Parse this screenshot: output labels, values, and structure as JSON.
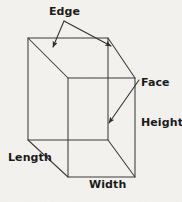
{
  "figure": {
    "background_color": "#f7f6f4",
    "line_color": "#3b3b3b",
    "text_color": "#1b1b1b",
    "labels": {
      "edge": "Edge",
      "face": "Face",
      "height": "Height",
      "length": "Length",
      "width": "Width"
    },
    "shape": {
      "type": "cuboid",
      "front_face": {
        "top_left": [
          28,
          38
        ],
        "top_right": [
          108,
          38
        ],
        "bottom_right": [
          108,
          140
        ],
        "bottom_left": [
          28,
          140
        ]
      },
      "back_face": {
        "top_left": [
          68,
          78
        ],
        "top_right": [
          135,
          78
        ],
        "bottom_right": [
          135,
          177
        ],
        "bottom_left": [
          68,
          177
        ]
      },
      "hidden_edges": "none",
      "connector_edges": [
        [
          [
            28,
            38
          ],
          [
            68,
            78
          ]
        ],
        [
          [
            108,
            38
          ],
          [
            135,
            78
          ]
        ],
        [
          [
            108,
            140
          ],
          [
            135,
            177
          ]
        ],
        [
          [
            28,
            140
          ],
          [
            68,
            177
          ]
        ]
      ]
    },
    "annotations": [
      {
        "name": "edge-arrow-left",
        "from": [
          64,
          21
        ],
        "to": [
          53,
          48
        ],
        "target": "top-left slanted edge"
      },
      {
        "name": "edge-arrow-right",
        "from": [
          64,
          21
        ],
        "to": [
          112,
          47
        ],
        "target": "top-right slanted edge"
      },
      {
        "name": "face-arrow",
        "from": [
          139,
          80
        ],
        "to": [
          108,
          124
        ],
        "target": "right side face"
      }
    ]
  }
}
